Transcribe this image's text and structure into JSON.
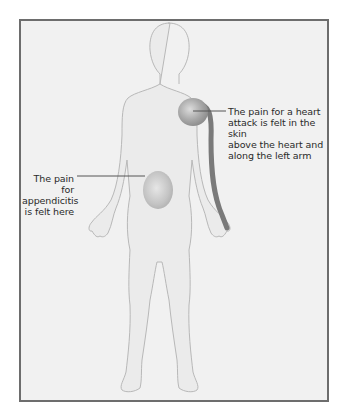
{
  "diagram": {
    "type": "referred-pain-body-diagram",
    "colors": {
      "background": "#f1f1f1",
      "frame_border": "#6d6d6d",
      "body_outline": "#b8b8b8",
      "body_fill": "#ebebeb",
      "pain_region": "#a6a6a6",
      "arm_path": "#7a7a7a",
      "leader_line": "#555555",
      "text": "#2a2a2a"
    },
    "annotations": [
      {
        "id": "heart",
        "lines": [
          "The pain for a heart",
          "attack is felt in the skin",
          "above the heart and",
          "along the left arm"
        ]
      },
      {
        "id": "appendicitis",
        "lines": [
          "The pain for",
          "appendicitis",
          "is felt here"
        ]
      }
    ]
  }
}
